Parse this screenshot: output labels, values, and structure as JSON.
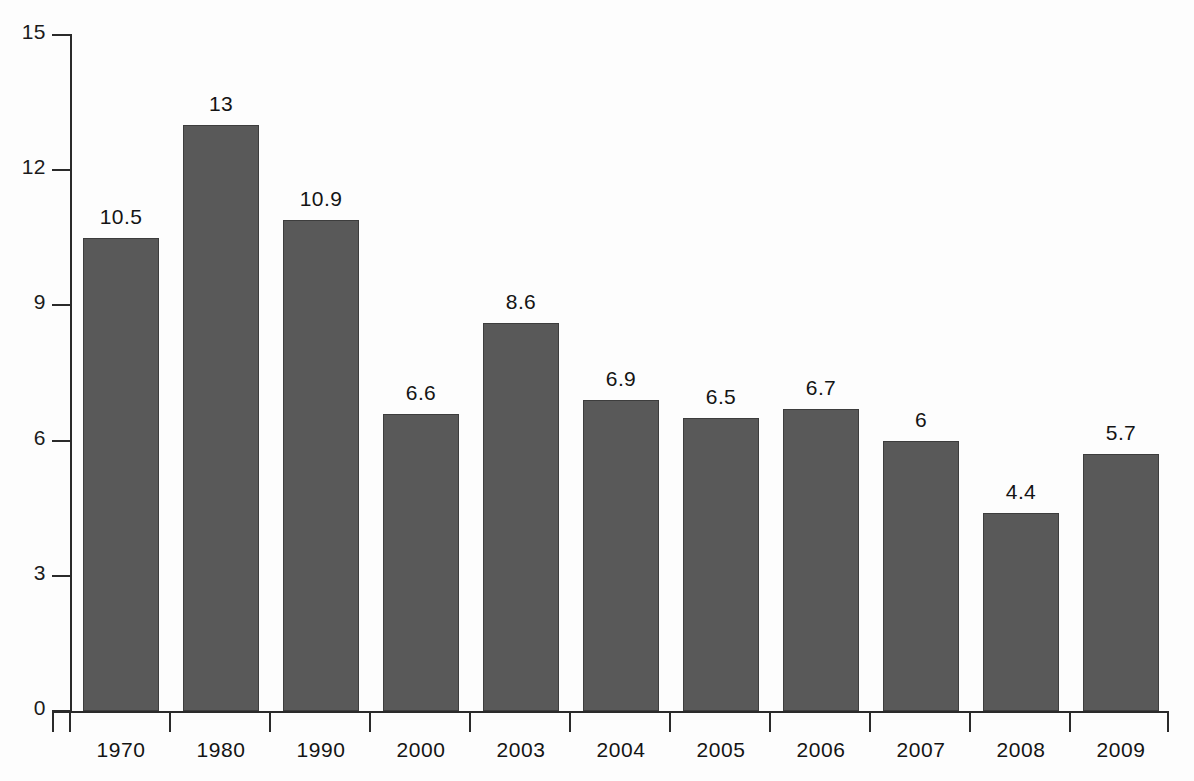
{
  "chart_data": {
    "type": "bar",
    "title": "",
    "subtitle": "",
    "xlabel": "",
    "ylabel": "",
    "categories": [
      "1970",
      "1980",
      "1990",
      "2000",
      "2003",
      "2004",
      "2005",
      "2006",
      "2007",
      "2008",
      "2009"
    ],
    "values": [
      10.5,
      13,
      10.9,
      6.6,
      8.6,
      6.9,
      6.5,
      6.7,
      6,
      4.4,
      5.7
    ],
    "value_labels": [
      "10.5",
      "13",
      "10.9",
      "6.6",
      "8.6",
      "6.9",
      "6.5",
      "6.7",
      "6",
      "4.4",
      "5.7"
    ],
    "ylim": [
      0,
      15
    ],
    "yticks": [
      0,
      3,
      6,
      9,
      12,
      15
    ],
    "ytick_labels": [
      "0",
      "3",
      "6",
      "9",
      "12",
      "15"
    ],
    "grid": false,
    "legend": null,
    "bar_color": "#595959",
    "bar_edge_color": "#3d3d3d",
    "axis_color": "#2a2a2a",
    "text_color": "#141414",
    "background_color": "#fdfdfd"
  }
}
